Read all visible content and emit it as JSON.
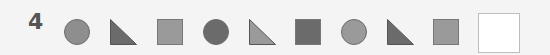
{
  "question_number": "4",
  "sequence": [
    {
      "shape": "circle",
      "fill": "#8e8e8e",
      "x": 64
    },
    {
      "shape": "right-triangle",
      "fill": "#6b6b6b",
      "x": 110
    },
    {
      "shape": "square",
      "fill": "#9a9a9a",
      "x": 157
    },
    {
      "shape": "circle",
      "fill": "#6b6b6b",
      "x": 203
    },
    {
      "shape": "right-triangle",
      "fill": "#9a9a9a",
      "x": 249
    },
    {
      "shape": "square",
      "fill": "#6b6b6b",
      "x": 295
    },
    {
      "shape": "circle",
      "fill": "#9a9a9a",
      "x": 341
    },
    {
      "shape": "right-triangle",
      "fill": "#6b6b6b",
      "x": 387
    },
    {
      "shape": "square",
      "fill": "#9a9a9a",
      "x": 433
    }
  ],
  "answer_box": {
    "value": ""
  }
}
